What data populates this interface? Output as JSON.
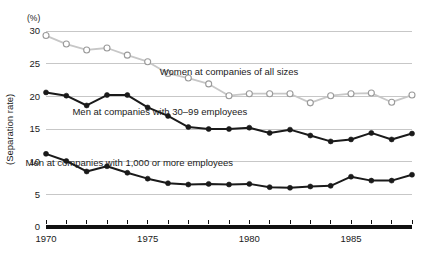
{
  "chart_data": {
    "type": "line",
    "title": "",
    "xlabel": "",
    "ylabel": "(Separation rate)",
    "yunit": "(%)",
    "xlim": [
      1970,
      1988
    ],
    "ylim": [
      0,
      30
    ],
    "grid": true,
    "legend_position": "inline-annotations",
    "x": [
      1970,
      1971,
      1972,
      1973,
      1974,
      1975,
      1976,
      1977,
      1978,
      1979,
      1980,
      1981,
      1982,
      1983,
      1984,
      1985,
      1986,
      1987,
      1988
    ],
    "xticks": [
      1970,
      1975,
      1980,
      1985
    ],
    "xtick_labels": [
      "1970",
      "1975",
      "1980",
      "1985"
    ],
    "yticks": [
      0,
      5,
      10,
      15,
      20,
      25,
      30
    ],
    "ytick_labels": [
      "0",
      "5",
      "10",
      "15",
      "20",
      "25",
      "30"
    ],
    "series": [
      {
        "name": "Women at companies of all sizes",
        "marker": "open-circle",
        "color": "#c7c7c7",
        "label_x": 1979.0,
        "label_y": 23.2,
        "values": [
          29.3,
          28.0,
          27.1,
          27.4,
          26.3,
          25.3,
          23.5,
          22.8,
          21.9,
          20.1,
          20.4,
          20.4,
          20.4,
          19.0,
          20.1,
          20.4,
          20.5,
          19.1,
          20.2
        ]
      },
      {
        "name": "Men at companies with 30–99 employees",
        "marker": "filled-circle",
        "color": "#1a1a1a",
        "label_x": 1975.6,
        "label_y": 17.2,
        "values": [
          20.6,
          20.1,
          18.6,
          20.2,
          20.2,
          18.3,
          17.0,
          15.3,
          15.0,
          15.0,
          15.2,
          14.4,
          14.9,
          14.0,
          13.1,
          13.4,
          14.4,
          13.4,
          14.3
        ]
      },
      {
        "name": "Men at companies with 1,000 or more employees",
        "marker": "filled-circle",
        "color": "#1a1a1a",
        "label_x": 1974.1,
        "label_y": 9.3,
        "values": [
          11.2,
          10.1,
          8.5,
          9.3,
          8.3,
          7.4,
          6.7,
          6.5,
          6.6,
          6.5,
          6.6,
          6.1,
          6.0,
          6.2,
          6.3,
          7.7,
          7.1,
          7.1,
          8.0
        ]
      }
    ]
  }
}
